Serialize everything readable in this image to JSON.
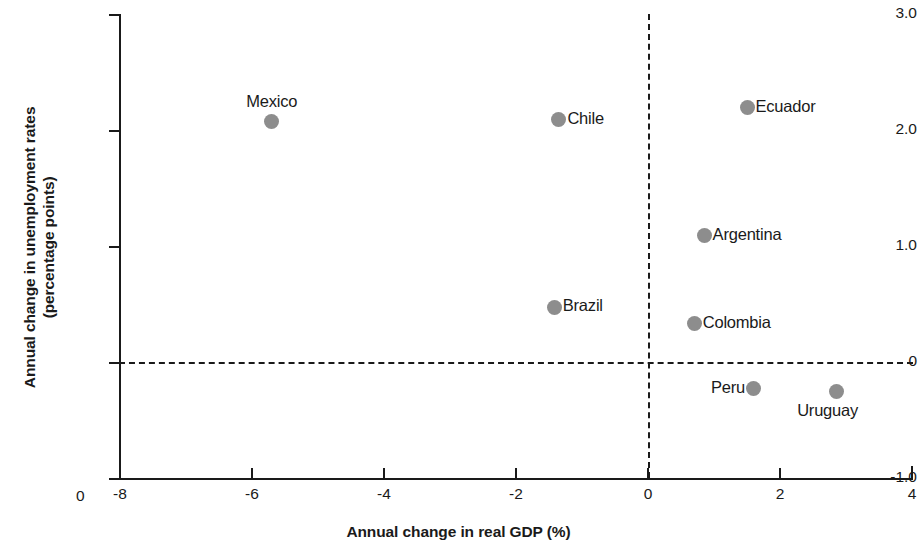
{
  "chart_data": {
    "type": "scatter",
    "title": "",
    "xlabel": "Annual change in real GDP (%)",
    "ylabel": "Annual change in unemployment rates\n(percentage points)",
    "xlim": [
      -8,
      4
    ],
    "ylim": [
      -1.0,
      3.0
    ],
    "xticks": [
      "-8",
      "-6",
      "-4",
      "-2",
      "0",
      "2",
      "4"
    ],
    "xtick_values": [
      -8,
      -6,
      -4,
      -2,
      0,
      2,
      4
    ],
    "yticks": [
      "3.0",
      "2.0",
      "1.0",
      "0",
      "-1.0"
    ],
    "ytick_values": [
      3.0,
      2.0,
      1.0,
      0,
      -1.0
    ],
    "origin_corner_label": "0",
    "grid": false,
    "legend": false,
    "reference_lines": [
      {
        "orientation": "horizontal",
        "value": 0,
        "style": "dashed"
      },
      {
        "orientation": "vertical",
        "value": 0,
        "style": "dashed"
      }
    ],
    "marker_color": "#8d8d8d",
    "points": [
      {
        "label": "Mexico",
        "x": -5.7,
        "y": 2.07,
        "label_pos": "above"
      },
      {
        "label": "Chile",
        "x": -1.35,
        "y": 2.09,
        "label_pos": "right"
      },
      {
        "label": "Ecuador",
        "x": 1.5,
        "y": 2.19,
        "label_pos": "right"
      },
      {
        "label": "Argentina",
        "x": 0.85,
        "y": 1.09,
        "label_pos": "right"
      },
      {
        "label": "Brazil",
        "x": -1.42,
        "y": 0.47,
        "label_pos": "right"
      },
      {
        "label": "Colombia",
        "x": 0.7,
        "y": 0.33,
        "label_pos": "right"
      },
      {
        "label": "Peru",
        "x": 1.6,
        "y": -0.23,
        "label_pos": "left"
      },
      {
        "label": "Uruguay",
        "x": 2.85,
        "y": -0.25,
        "label_pos": "below"
      }
    ]
  }
}
